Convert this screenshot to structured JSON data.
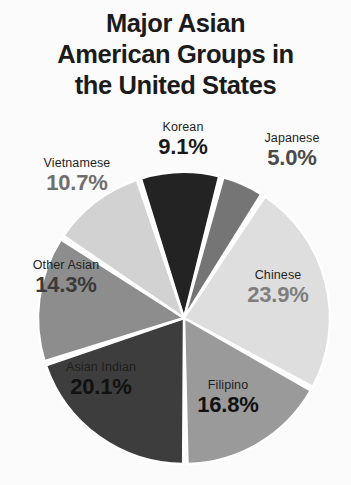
{
  "title": "Major Asian\nAmerican Groups in\nthe United States",
  "colors": {
    "background": "#fbfbfb",
    "title_text": "#1b1b1b",
    "slice_gap": "#ffffff"
  },
  "labels": {
    "korean": {
      "category": "Korean",
      "percent": "9.1%"
    },
    "japanese": {
      "category": "Japanese",
      "percent": "5.0%"
    },
    "chinese": {
      "category": "Chinese",
      "percent": "23.9%"
    },
    "filipino": {
      "category": "Filipino",
      "percent": "16.8%"
    },
    "asianindian": {
      "category": "Asian Indian",
      "percent": "20.1%"
    },
    "otherasian": {
      "category": "Other Asian",
      "percent": "14.3%"
    },
    "vietnamese": {
      "category": "Vietnamese",
      "percent": "10.7%"
    }
  },
  "chart_data": {
    "type": "pie",
    "title": "Major Asian American Groups in the United States",
    "xlabel": "",
    "ylabel": "",
    "legend_position": "none",
    "grid": false,
    "labels_on_slices": false,
    "value_unit": "percent",
    "start_angle_deg": -18,
    "direction": "clockwise",
    "categories": [
      "Korean",
      "Japanese",
      "Chinese",
      "Filipino",
      "Asian Indian",
      "Other Asian",
      "Vietnamese"
    ],
    "values": [
      9.1,
      5.0,
      23.9,
      16.8,
      20.1,
      14.3,
      10.7
    ],
    "slices": [
      {
        "name": "Korean",
        "value": 9.1,
        "color": "#232323"
      },
      {
        "name": "Japanese",
        "value": 5.0,
        "color": "#757575"
      },
      {
        "name": "Chinese",
        "value": 23.9,
        "color": "#dedede"
      },
      {
        "name": "Filipino",
        "value": 16.8,
        "color": "#9a9a9a"
      },
      {
        "name": "Asian Indian",
        "value": 20.1,
        "color": "#3d3d3d"
      },
      {
        "name": "Other Asian",
        "value": 14.3,
        "color": "#8d8d8d"
      },
      {
        "name": "Vietnamese",
        "value": 10.7,
        "color": "#d2d2d2"
      }
    ],
    "total": 99.9
  }
}
